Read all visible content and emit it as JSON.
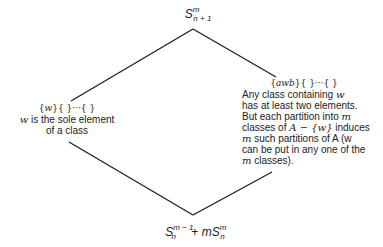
{
  "diagram": {
    "top_node": {
      "base": "S",
      "superscript": "m",
      "subscript": "n + 1"
    },
    "bottom_node": {
      "term1_base": "S",
      "term1_superscript": "m − 1",
      "term1_subscript": "n",
      "operator": " + ",
      "term2_coef": "m",
      "term2_base": "S",
      "term2_superscript": "m",
      "term2_subscript": "n"
    },
    "left_node": {
      "set_notation_var": "w",
      "set_notation_rest": "}{   }···{   }",
      "desc_var": "w",
      "desc_line1_rest": " is the sole element",
      "desc_line2": "of a class"
    },
    "right_node": {
      "set_notation_var": "awb",
      "set_notation_rest": "}{   }···{   }",
      "lines": [
        {
          "text": "Any class containing ",
          "var": "w",
          "after": ""
        },
        {
          "text": "has at least two elements.",
          "var": "",
          "after": ""
        },
        {
          "text": "But each partition into ",
          "var": "m",
          "after": ""
        },
        {
          "text": "classes of ",
          "var": "A − {w}",
          "after": " induces"
        },
        {
          "text": "",
          "var": "m",
          "after": " such partitions of A (w"
        },
        {
          "text": "can be put in any one of the",
          "var": "",
          "after": ""
        },
        {
          "text": "",
          "var": "m",
          "after": " classes)."
        }
      ]
    },
    "edges": [
      {
        "from": "top",
        "to": "left",
        "x1": 193,
        "y1": 29,
        "x2": 71,
        "y2": 101
      },
      {
        "from": "top",
        "to": "right",
        "x1": 193,
        "y1": 29,
        "x2": 276,
        "y2": 77
      },
      {
        "from": "left",
        "to": "bottom",
        "x1": 69,
        "y1": 142,
        "x2": 193,
        "y2": 215
      },
      {
        "from": "right",
        "to": "bottom",
        "x1": 272,
        "y1": 172,
        "x2": 193,
        "y2": 215
      }
    ],
    "line_color": "#222222"
  }
}
